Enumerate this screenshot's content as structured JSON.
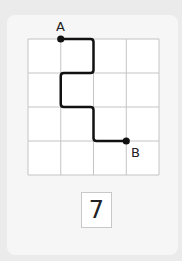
{
  "diagram": {
    "grid": {
      "cols": 4,
      "rows": 4,
      "left": 28,
      "top": 39,
      "cell_w": 32.75,
      "cell_h": 34,
      "line_color": "#c4c4c4",
      "fill": "#ffffff"
    },
    "path": {
      "color": "#111111",
      "points": [
        [
          1,
          0
        ],
        [
          2,
          0
        ],
        [
          2,
          1
        ],
        [
          1,
          1
        ],
        [
          1,
          2
        ],
        [
          2,
          2
        ],
        [
          2,
          3
        ],
        [
          3,
          3
        ]
      ]
    },
    "start": {
      "label": "A",
      "point": [
        1,
        0
      ]
    },
    "end": {
      "label": "B",
      "point": [
        3,
        3
      ]
    }
  },
  "answer": {
    "value": "7"
  }
}
